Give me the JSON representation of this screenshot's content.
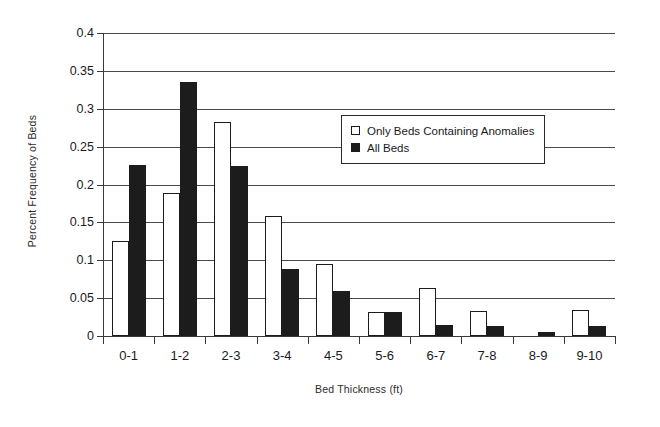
{
  "chart_data": {
    "type": "bar",
    "title": "",
    "xlabel": "Bed Thickness (ft)",
    "ylabel": "Percent Frequency of Beds",
    "categories": [
      "0-1",
      "1-2",
      "2-3",
      "3-4",
      "4-5",
      "5-6",
      "6-7",
      "7-8",
      "8-9",
      "9-10"
    ],
    "series": [
      {
        "name": "Only Beds Containing Anomalies",
        "color": "#ffffff",
        "values": [
          0.125,
          0.189,
          0.282,
          0.158,
          0.095,
          0.032,
          0.064,
          0.033,
          0.0,
          0.034
        ]
      },
      {
        "name": "All Beds",
        "color": "#1c1c1c",
        "values": [
          0.226,
          0.335,
          0.224,
          0.089,
          0.06,
          0.032,
          0.015,
          0.013,
          0.005,
          0.013
        ]
      }
    ],
    "ylim": [
      0,
      0.4
    ],
    "ytick_values": [
      0,
      0.05,
      0.1,
      0.15,
      0.2,
      0.25,
      0.3,
      0.35,
      0.4
    ],
    "ytick_labels": [
      "0",
      "0.05",
      "0.1",
      "0.15",
      "0.2",
      "0.25",
      "0.3",
      "0.35",
      "0.4"
    ],
    "grid": true,
    "grid_axis": "y",
    "legend_position": "upper right inside"
  },
  "legend": {
    "entries": [
      {
        "label": "Only Beds Containing Anomalies"
      },
      {
        "label": "All Beds"
      }
    ]
  }
}
